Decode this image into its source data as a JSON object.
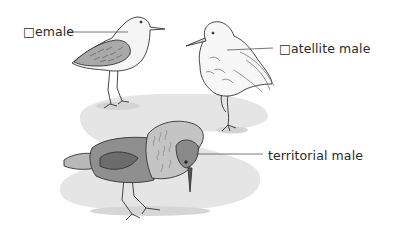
{
  "figure": {
    "colors": {
      "background": "#ffffff",
      "ground_shadow": "#e4e4e4",
      "ground_shadow_dark": "#d2d2d2",
      "outline": "#333333",
      "leader_line": "#555555",
      "label_text": "#2a2a2a",
      "territorial_body": "#8e8e8e",
      "territorial_ruff": "#bdbdbd",
      "female_wing": "#a8a8a8",
      "satellite_body": "#f4f4f4"
    }
  },
  "labels": {
    "female": "□emale",
    "satellite_male": "□atellite male",
    "territorial_male": "territorial male"
  },
  "birds": [
    {
      "id": "female",
      "label_ref": "labels.female"
    },
    {
      "id": "satellite_male",
      "label_ref": "labels.satellite_male"
    },
    {
      "id": "territorial_male",
      "label_ref": "labels.territorial_male"
    }
  ]
}
